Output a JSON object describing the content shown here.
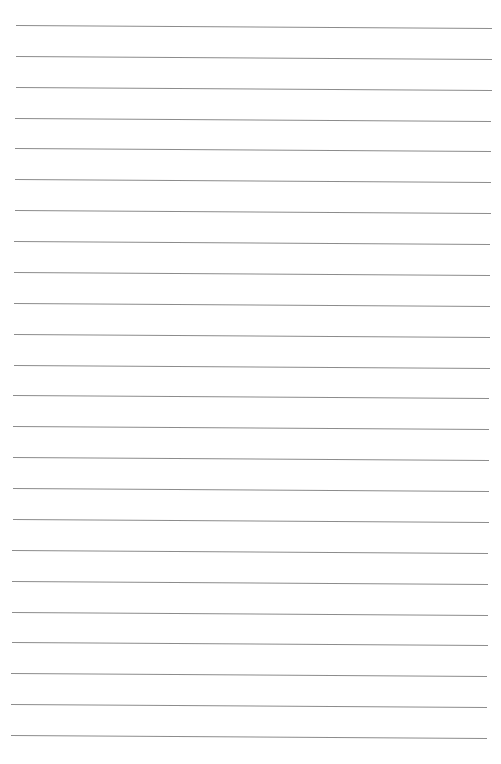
{
  "page": {
    "type": "lined-paper",
    "background": "#ffffff",
    "rule_color": "#8c8c8c",
    "rule_count": 24,
    "first_rule_y": 25,
    "rule_spacing": 30.87,
    "left_x_top": 16,
    "left_x_bottom": 11,
    "right_x_top": 492,
    "right_x_bottom": 487,
    "slope_deg": 0.35
  }
}
